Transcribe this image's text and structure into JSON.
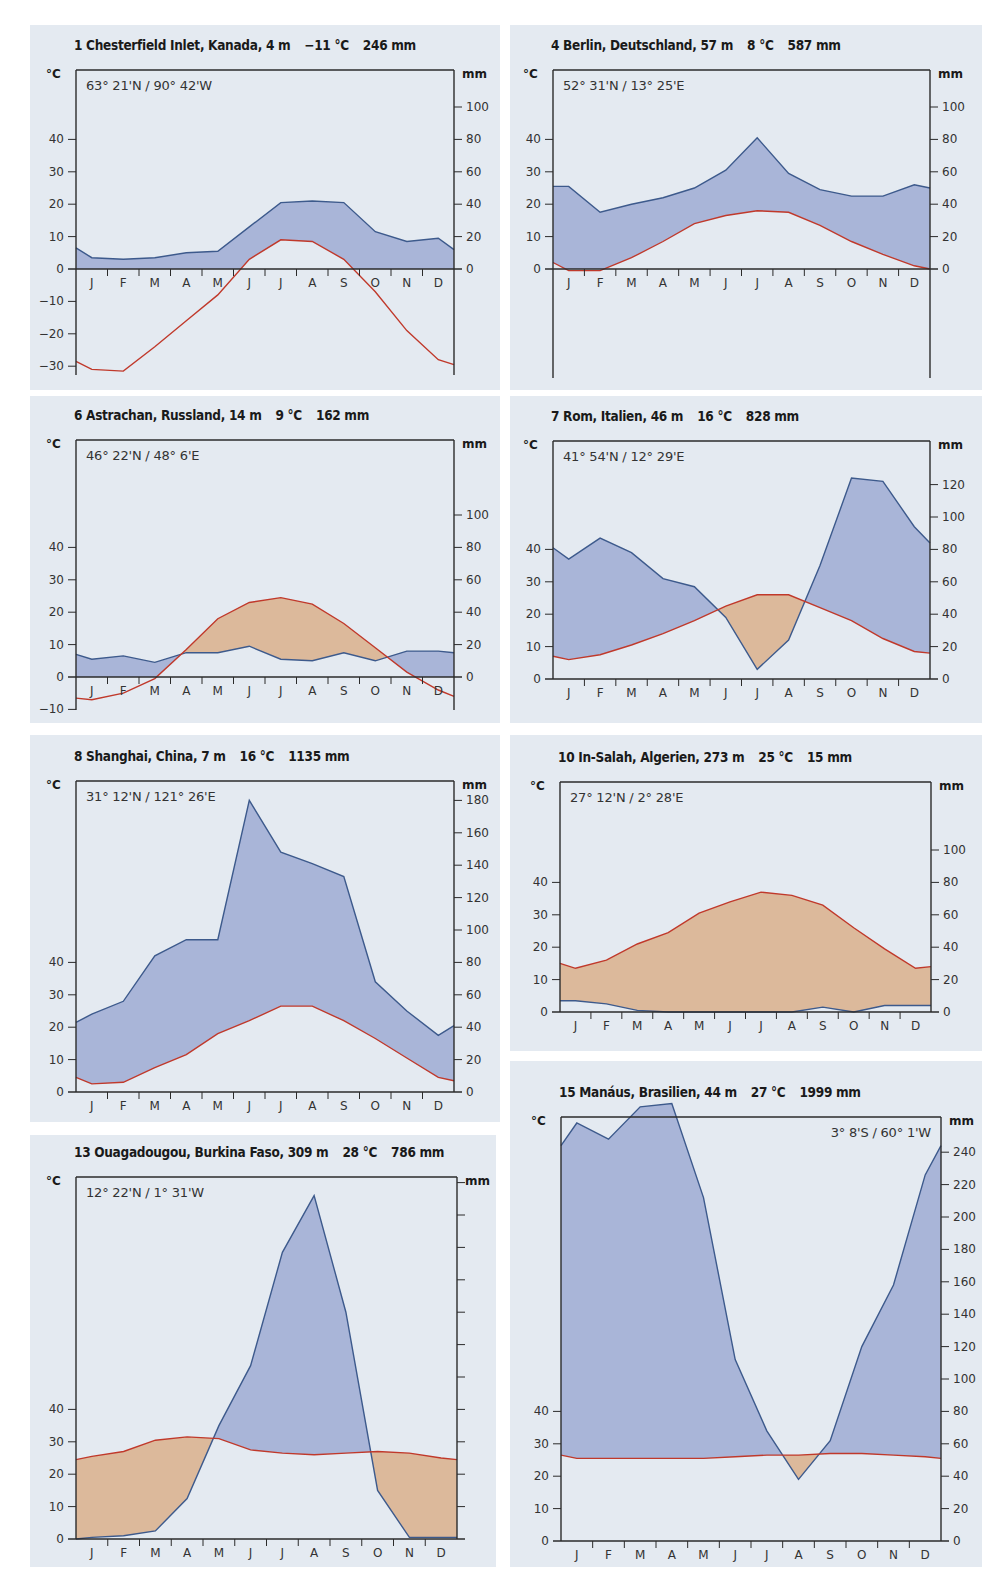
{
  "colors": {
    "panel_bg": "#e4eaf1",
    "humid_fill": "#a9b5d8",
    "arid_fill": "#dcb99b",
    "precip_line": "#3d5a8c",
    "temp_line": "#c0392b",
    "axis": "#2b2b2b"
  },
  "months": [
    "J",
    "F",
    "M",
    "A",
    "M",
    "J",
    "J",
    "A",
    "S",
    "O",
    "N",
    "D"
  ],
  "chart_data": [
    {
      "type": "climate_diagram",
      "id": 1,
      "title": "1 Chesterfield Inlet, Kanada, 4 m",
      "station": "Chesterfield Inlet, Kanada",
      "elevation": "4 m",
      "mean_temp": "−11 °C",
      "annual_precip": "246 mm",
      "coords": "63° 21'N / 90° 42'W",
      "left_axis_label": "°C",
      "right_axis_label": "mm",
      "temp_ticks": [
        -30,
        -20,
        -10,
        0,
        10,
        20,
        30,
        40
      ],
      "precip_ticks": [
        0,
        20,
        40,
        60,
        80,
        100
      ],
      "categories": [
        "J",
        "F",
        "M",
        "A",
        "M",
        "J",
        "J",
        "A",
        "S",
        "O",
        "N",
        "D"
      ],
      "temperature_c": [
        -31,
        -31.5,
        -24,
        -16,
        -8,
        3,
        9,
        8.5,
        3,
        -7,
        -19,
        -28
      ],
      "precipitation_mm": [
        7,
        6,
        7,
        10,
        11,
        26,
        41,
        42,
        41,
        23,
        17,
        19
      ],
      "edge_temp": [
        -28.5,
        -29.5
      ],
      "edge_precip": [
        13,
        12
      ]
    },
    {
      "type": "climate_diagram",
      "id": 4,
      "title": "4 Berlin, Deutschland, 57 m",
      "station": "Berlin, Deutschland",
      "elevation": "57 m",
      "mean_temp": "8 °C",
      "annual_precip": "587 mm",
      "coords": "52° 31'N / 13° 25'E",
      "left_axis_label": "°C",
      "right_axis_label": "mm",
      "temp_ticks": [
        0,
        10,
        20,
        30,
        40
      ],
      "precip_ticks": [
        0,
        20,
        40,
        60,
        80,
        100
      ],
      "categories": [
        "J",
        "F",
        "M",
        "A",
        "M",
        "J",
        "J",
        "A",
        "S",
        "O",
        "N",
        "D"
      ],
      "temperature_c": [
        -0.5,
        -0.5,
        3.5,
        8.5,
        14,
        16.5,
        18,
        17.5,
        13.5,
        8.5,
        4.5,
        1
      ],
      "precipitation_mm": [
        51,
        35,
        40,
        44,
        50,
        61,
        81,
        59,
        49,
        45,
        45,
        52
      ],
      "edge_temp": [
        2,
        0
      ],
      "edge_precip": [
        51,
        50
      ],
      "temp_axis_min": -30
    },
    {
      "type": "climate_diagram",
      "id": 6,
      "title": "6 Astrachan, Russland, 14 m",
      "station": "Astrachan, Russland",
      "elevation": "14 m",
      "mean_temp": "9 °C",
      "annual_precip": "162 mm",
      "coords": "46° 22'N / 48° 6'E",
      "left_axis_label": "°C",
      "right_axis_label": "mm",
      "temp_ticks": [
        -10,
        0,
        10,
        20,
        30,
        40
      ],
      "precip_ticks": [
        0,
        20,
        40,
        60,
        80,
        100
      ],
      "categories": [
        "J",
        "F",
        "M",
        "A",
        "M",
        "J",
        "J",
        "A",
        "S",
        "O",
        "N",
        "D"
      ],
      "temperature_c": [
        -7,
        -5,
        -0.5,
        8.5,
        18,
        23,
        24.5,
        22.5,
        16.5,
        9,
        1.5,
        -4
      ],
      "precipitation_mm": [
        11,
        13,
        9,
        15,
        15,
        19,
        11,
        10,
        15,
        10,
        16,
        16
      ],
      "edge_temp": [
        -6.5,
        -6
      ],
      "edge_precip": [
        14,
        15
      ]
    },
    {
      "type": "climate_diagram",
      "id": 7,
      "title": "7 Rom, Italien, 46 m",
      "station": "Rom, Italien",
      "elevation": "46 m",
      "mean_temp": "16 °C",
      "annual_precip": "828 mm",
      "coords": "41° 54'N / 12° 29'E",
      "left_axis_label": "°C",
      "right_axis_label": "mm",
      "temp_ticks": [
        0,
        10,
        20,
        30,
        40
      ],
      "precip_ticks": [
        0,
        20,
        40,
        60,
        80,
        100,
        120
      ],
      "categories": [
        "J",
        "F",
        "M",
        "A",
        "M",
        "J",
        "J",
        "A",
        "S",
        "O",
        "N",
        "D"
      ],
      "temperature_c": [
        6,
        7.5,
        10.5,
        14,
        18,
        22.5,
        26,
        26,
        22,
        18,
        12.5,
        8.5
      ],
      "precipitation_mm": [
        74,
        87,
        78,
        62,
        57,
        38,
        6,
        24,
        70,
        124,
        122,
        94
      ],
      "edge_temp": [
        7,
        8
      ],
      "edge_precip": [
        81,
        84
      ]
    },
    {
      "type": "climate_diagram",
      "id": 8,
      "title": "8 Shanghai, China, 7 m",
      "station": "Shanghai, China",
      "elevation": "7 m",
      "mean_temp": "16 °C",
      "annual_precip": "1135 mm",
      "coords": "31° 12'N / 121° 26'E",
      "left_axis_label": "°C",
      "right_axis_label": "mm",
      "temp_ticks": [
        0,
        10,
        20,
        30,
        40
      ],
      "precip_ticks": [
        0,
        20,
        40,
        60,
        80,
        100,
        120,
        140,
        160,
        180
      ],
      "categories": [
        "J",
        "F",
        "M",
        "A",
        "M",
        "J",
        "J",
        "A",
        "S",
        "O",
        "N",
        "D"
      ],
      "temperature_c": [
        2.5,
        3,
        7.5,
        11.5,
        18,
        22,
        26.5,
        26.5,
        22,
        16.5,
        10.5,
        4.5
      ],
      "precipitation_mm": [
        48,
        56,
        84,
        94,
        94,
        180,
        148,
        141,
        133,
        68,
        50,
        35
      ],
      "edge_temp": [
        4.5,
        3.5
      ],
      "edge_precip": [
        43,
        41
      ]
    },
    {
      "type": "climate_diagram",
      "id": 10,
      "title": "10 In-Salah, Algerien, 273 m",
      "station": "In-Salah, Algerien",
      "elevation": "273 m",
      "mean_temp": "25 °C",
      "annual_precip": "15 mm",
      "coords": "27° 12'N / 2° 28'E",
      "left_axis_label": "°C",
      "right_axis_label": "mm",
      "temp_ticks": [
        0,
        10,
        20,
        30,
        40
      ],
      "precip_ticks": [
        0,
        20,
        40,
        60,
        80,
        100
      ],
      "categories": [
        "J",
        "F",
        "M",
        "A",
        "M",
        "J",
        "J",
        "A",
        "S",
        "O",
        "N",
        "D"
      ],
      "temperature_c": [
        13.5,
        16,
        21,
        24.5,
        30.5,
        34,
        37,
        36,
        33,
        26,
        19.5,
        13.5
      ],
      "precipitation_mm": [
        7,
        5,
        1,
        0,
        0,
        0,
        0,
        0,
        3,
        0,
        4,
        4
      ],
      "edge_temp": [
        15,
        14
      ],
      "edge_precip": [
        7,
        4
      ]
    },
    {
      "type": "climate_diagram",
      "id": 13,
      "title": "13 Ouagadougou, Burkina Faso, 309 m",
      "station": "Ouagadougou, Burkina Faso",
      "elevation": "309 m",
      "mean_temp": "28 °C",
      "annual_precip": "786 mm",
      "coords": "12° 22'N / 1° 31'W",
      "left_axis_label": "°C",
      "right_axis_label": "mm",
      "temp_ticks": [
        0,
        10,
        20,
        30,
        40
      ],
      "precip_ticks": [
        0,
        20,
        40,
        60,
        80,
        100,
        120,
        140,
        160,
        180,
        200,
        220
      ],
      "precip_tick_labels_visible": false,
      "categories": [
        "J",
        "F",
        "M",
        "A",
        "M",
        "J",
        "J",
        "A",
        "S",
        "O",
        "N",
        "D"
      ],
      "temperature_c": [
        25.5,
        27,
        30.5,
        31.5,
        31,
        27.5,
        26.5,
        26,
        26.5,
        27,
        26.5,
        25
      ],
      "precipitation_mm": [
        1,
        2,
        5,
        25,
        70,
        107,
        177,
        212,
        140,
        30,
        1,
        1
      ],
      "edge_temp": [
        24.5,
        24.5
      ],
      "edge_precip": [
        0,
        1
      ]
    },
    {
      "type": "climate_diagram",
      "id": 15,
      "title": "15 Manáus, Brasilien, 44 m",
      "station": "Manáus, Brasilien",
      "elevation": "44 m",
      "mean_temp": "27 °C",
      "annual_precip": "1999 mm",
      "coords": "3° 8'S / 60° 1'W",
      "left_axis_label": "°C",
      "right_axis_label": "mm",
      "temp_ticks": [
        0,
        10,
        20,
        30,
        40
      ],
      "precip_ticks": [
        0,
        20,
        40,
        60,
        80,
        100,
        120,
        140,
        160,
        180,
        200,
        220,
        240
      ],
      "categories": [
        "J",
        "F",
        "M",
        "A",
        "M",
        "J",
        "J",
        "A",
        "S",
        "O",
        "N",
        "D"
      ],
      "temperature_c": [
        25.5,
        25.5,
        25.5,
        25.5,
        25.5,
        26,
        26.5,
        26.5,
        27,
        27,
        26.5,
        26
      ],
      "precipitation_mm": [
        258,
        248,
        268,
        270,
        212,
        112,
        68,
        38,
        62,
        120,
        158,
        226
      ],
      "edge_temp": [
        26.5,
        25.5
      ],
      "edge_precip": [
        244,
        244
      ],
      "coords_align": "right"
    }
  ],
  "panels": [
    {
      "id": "chesterfield",
      "x": 30,
      "y": 25,
      "w": 470,
      "h": 365,
      "plotL": 76,
      "plotR": 454,
      "plotTop": 70,
      "zeroY": 269,
      "pxPer10": 32.4,
      "plotBottom": 375
    },
    {
      "id": "berlin",
      "x": 510,
      "y": 25,
      "w": 472,
      "h": 365,
      "plotL": 553,
      "plotR": 930,
      "plotTop": 70,
      "zeroY": 269,
      "pxPer10": 32.4,
      "plotBottom": 378
    },
    {
      "id": "astrachan",
      "x": 30,
      "y": 396,
      "w": 470,
      "h": 327,
      "plotL": 76,
      "plotR": 454,
      "plotTop": 440,
      "zeroY": 677,
      "pxPer10": 32.4,
      "plotBottom": 710
    },
    {
      "id": "rom",
      "x": 510,
      "y": 396,
      "w": 472,
      "h": 327,
      "plotL": 553,
      "plotR": 930,
      "plotTop": 441,
      "zeroY": 679,
      "pxPer10": 32.4,
      "plotBottom": 679
    },
    {
      "id": "shanghai",
      "x": 30,
      "y": 735,
      "w": 470,
      "h": 387,
      "plotL": 76,
      "plotR": 454,
      "plotTop": 781,
      "zeroY": 1092,
      "pxPer10": 32.4,
      "plotBottom": 1092
    },
    {
      "id": "insalah",
      "x": 510,
      "y": 735,
      "w": 472,
      "h": 316,
      "plotL": 560,
      "plotR": 931,
      "plotTop": 782,
      "zeroY": 1012,
      "pxPer10": 32.4,
      "plotBottom": 1012
    },
    {
      "id": "ouagadougou",
      "x": 30,
      "y": 1135,
      "w": 466,
      "h": 432,
      "plotL": 76,
      "plotR": 457,
      "plotTop": 1177,
      "zeroY": 1539,
      "pxPer10": 32.4,
      "plotBottom": 1539
    },
    {
      "id": "manaus",
      "x": 510,
      "y": 1061,
      "w": 472,
      "h": 506,
      "plotL": 561,
      "plotR": 941,
      "plotTop": 1117,
      "zeroY": 1541,
      "pxPer10": 32.4,
      "plotBottom": 1541
    }
  ]
}
